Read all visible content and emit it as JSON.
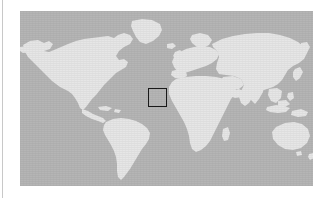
{
  "figure": {
    "kind": "world-map",
    "projection": "equirectangular",
    "frame": {
      "x": 20,
      "y": 11,
      "width": 293,
      "height": 175
    },
    "colors": {
      "ocean": "#b5b5b5",
      "land": "#e6e6e6",
      "roi_outline": "#1a1a1a",
      "page_background": "#ffffff",
      "margin_rule": "#c8c8c8"
    },
    "margin_rule": {
      "x": 2,
      "width": 1
    }
  },
  "roi": {
    "label": "",
    "outline_color": "#1a1a1a",
    "outline_width_px": 1.5,
    "box_px": {
      "x": 148,
      "y": 88,
      "width": 19,
      "height": 19
    },
    "box_pct": {
      "left": 43.7,
      "top": 44.0,
      "width": 6.5,
      "height": 10.9
    },
    "approx_lon_range": [
      -17,
      6
    ],
    "approx_lat_range": [
      34,
      53
    ],
    "region_hint": "Western Europe / Iberian Peninsula"
  },
  "landmasses": [
    {
      "name": "north-america"
    },
    {
      "name": "south-america"
    },
    {
      "name": "greenland"
    },
    {
      "name": "europe"
    },
    {
      "name": "africa"
    },
    {
      "name": "asia"
    },
    {
      "name": "australia"
    },
    {
      "name": "new-guinea"
    },
    {
      "name": "indonesia"
    },
    {
      "name": "new-zealand"
    },
    {
      "name": "japan"
    },
    {
      "name": "british-isles"
    },
    {
      "name": "madagascar"
    },
    {
      "name": "iceland"
    }
  ]
}
